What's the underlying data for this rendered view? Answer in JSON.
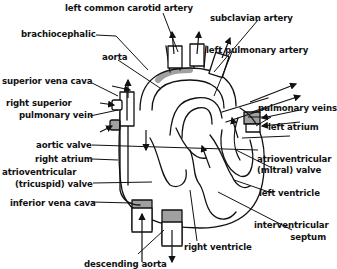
{
  "diagram": {
    "colors": {
      "ink": "#111111",
      "background": "#ffffff"
    },
    "labels": {
      "left_common_carotid_artery": "left common carotid artery",
      "subclavian_artery": "subclavian artery",
      "brachiocephalic": "brachiocephalic",
      "aorta": "aorta",
      "left_pulmonary_artery": "left pulmonary artery",
      "superior_vena_cava": "superior vena cava",
      "right_superior_pulmonary_vein_1": "right superior",
      "right_superior_pulmonary_vein_2": "pulmonary vein",
      "pulmonary_veins": "pulmonary veins",
      "left_atrium": "left atrium",
      "aortic_valve": "aortic valve",
      "right_atrium": "right atrium",
      "av_mitral_valve_1": "atrioventricular",
      "av_mitral_valve_2": "(mitral) valve",
      "av_tricuspid_valve_1": "atrioventricular",
      "av_tricuspid_valve_2": "(tricuspid) valve",
      "left_ventricle": "left ventricle",
      "inferior_vena_cava": "inferior vena cava",
      "interventricular_septum_1": "interventricular",
      "interventricular_septum_2": "septum",
      "right_ventricle": "right ventricle",
      "descending_aorta": "descending aorta"
    }
  }
}
